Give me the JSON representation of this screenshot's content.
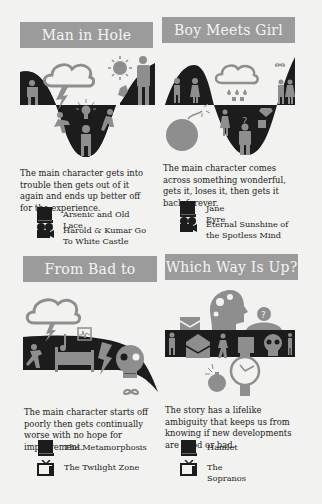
{
  "panels": [
    {
      "title": "Man in Hole",
      "description": "The main character gets into trouble then gets out of it again and ends up better off for the experience.",
      "examples": [
        {
          "type": "book",
          "icon": "book-icon",
          "label": "Arsenic and Old Lace"
        },
        {
          "type": "film",
          "icon": "film-reel-icon",
          "label": "Harold & Kumar Go To White Castle"
        }
      ]
    },
    {
      "title": "Boy Meets Girl",
      "description": "The main character comes across something wonderful, gets it, loses it, then gets it back forever.",
      "examples": [
        {
          "type": "book",
          "icon": "book-icon",
          "label": "Jane Eyre"
        },
        {
          "type": "film",
          "icon": "film-reel-icon",
          "label": "Eternal Sunshine of the Spotless Mind"
        }
      ]
    },
    {
      "title": "From Bad to Worse",
      "description": "The main character starts off poorly then gets continually worse with no hope for improvement.",
      "examples": [
        {
          "type": "book",
          "icon": "book-icon",
          "label": "The Metamorphosis"
        },
        {
          "type": "tv",
          "icon": "tv-icon",
          "label": "The Twilight Zone"
        }
      ]
    },
    {
      "title": "Which Way Is Up?",
      "description": "The story has a lifelike ambiguity that keeps us from knowing if new developments are good or bad.",
      "examples": [
        {
          "type": "book",
          "icon": "book-icon",
          "label": "Hamlet"
        },
        {
          "type": "tv",
          "icon": "tv-icon",
          "label": "The Sopranos"
        }
      ]
    }
  ],
  "colors": {
    "background": "#f2f2f0",
    "banner": "#9b9b9b",
    "banner_text": "#f4f4f4",
    "curve_fill": "#1c1c1c",
    "icon_gray": "#8e8e8e"
  }
}
